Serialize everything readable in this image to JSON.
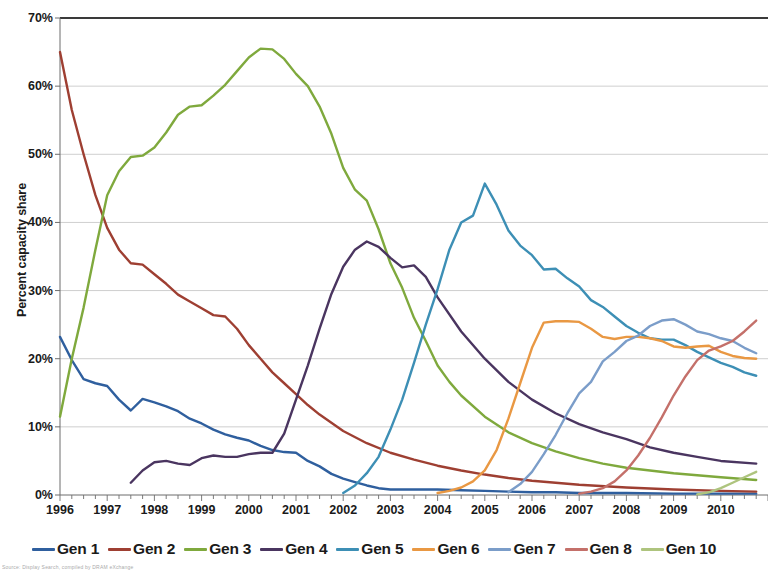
{
  "chart_data": {
    "type": "line",
    "title": "",
    "xlabel": "",
    "ylabel": "Percent capacity share",
    "xlim": [
      1996,
      2011
    ],
    "ylim": [
      0,
      0.7
    ],
    "ytick_labels": [
      "0%",
      "10%",
      "20%",
      "30%",
      "40%",
      "50%",
      "60%",
      "70%"
    ],
    "ytick_values": [
      0,
      10,
      20,
      30,
      40,
      50,
      60,
      70
    ],
    "xtick_labels": [
      "1996",
      "1997",
      "1998",
      "1999",
      "2000",
      "2001",
      "2002",
      "2003",
      "2004",
      "2005",
      "2006",
      "2007",
      "2008",
      "2009",
      "2010"
    ],
    "xtick_values": [
      1996,
      1997,
      1998,
      1999,
      2000,
      2001,
      2002,
      2003,
      2004,
      2005,
      2006,
      2007,
      2008,
      2009,
      2010
    ],
    "minor_xticks_per_year": 4,
    "grid": "horizontal",
    "legend_position": "bottom",
    "series": [
      {
        "name": "Gen 1",
        "color": "#2f5f9e",
        "x": [
          1996.0,
          1996.25,
          1996.5,
          1996.75,
          1997.0,
          1997.25,
          1997.5,
          1997.75,
          1998.0,
          1998.25,
          1998.5,
          1998.75,
          1999.0,
          1999.25,
          1999.5,
          1999.75,
          2000.0,
          2000.25,
          2000.5,
          2000.75,
          2001.0,
          2001.25,
          2001.5,
          2001.75,
          2002.0,
          2002.25,
          2002.5,
          2002.75,
          2003.0,
          2003.5,
          2004.0,
          2004.5,
          2005.0,
          2005.5,
          2006.0,
          2006.5,
          2007.0,
          2008.0,
          2009.0,
          2010.0,
          2010.75
        ],
        "y": [
          23.2,
          19.8,
          17.0,
          16.4,
          16.0,
          14.0,
          12.4,
          14.1,
          13.6,
          13.0,
          12.3,
          11.2,
          10.5,
          9.6,
          8.9,
          8.4,
          8.0,
          7.2,
          6.6,
          6.3,
          6.2,
          5.0,
          4.2,
          3.1,
          2.4,
          1.9,
          1.4,
          1.0,
          0.8,
          0.8,
          0.8,
          0.7,
          0.6,
          0.5,
          0.4,
          0.4,
          0.3,
          0.3,
          0.2,
          0.2,
          0.2
        ]
      },
      {
        "name": "Gen 2",
        "color": "#9e3f32",
        "x": [
          1996.0,
          1996.25,
          1996.5,
          1996.75,
          1997.0,
          1997.25,
          1997.5,
          1997.75,
          1998.0,
          1998.25,
          1998.5,
          1998.75,
          1999.0,
          1999.25,
          1999.5,
          1999.75,
          2000.0,
          2000.25,
          2000.5,
          2000.75,
          2001.0,
          2001.25,
          2001.5,
          2001.75,
          2002.0,
          2002.5,
          2003.0,
          2003.5,
          2004.0,
          2004.5,
          2005.0,
          2005.5,
          2006.0,
          2006.5,
          2007.0,
          2008.0,
          2009.0,
          2010.0,
          2010.75
        ],
        "y": [
          65.0,
          56.5,
          50.0,
          44.0,
          39.2,
          36.0,
          34.0,
          33.8,
          32.4,
          31.0,
          29.4,
          28.4,
          27.4,
          26.4,
          26.2,
          24.4,
          22.0,
          20.0,
          18.0,
          16.4,
          14.8,
          13.2,
          11.8,
          10.6,
          9.4,
          7.6,
          6.2,
          5.2,
          4.3,
          3.6,
          3.0,
          2.5,
          2.1,
          1.8,
          1.5,
          1.1,
          0.8,
          0.6,
          0.5
        ]
      },
      {
        "name": "Gen 3",
        "color": "#7fa93d",
        "x": [
          1996.0,
          1996.25,
          1996.5,
          1996.75,
          1997.0,
          1997.25,
          1997.5,
          1997.75,
          1998.0,
          1998.25,
          1998.5,
          1998.75,
          1999.0,
          1999.25,
          1999.5,
          1999.75,
          2000.0,
          2000.25,
          2000.5,
          2000.75,
          2001.0,
          2001.25,
          2001.5,
          2001.75,
          2002.0,
          2002.25,
          2002.5,
          2002.75,
          2003.0,
          2003.25,
          2003.5,
          2003.75,
          2004.0,
          2004.25,
          2004.5,
          2005.0,
          2005.5,
          2006.0,
          2006.5,
          2007.0,
          2007.5,
          2008.0,
          2009.0,
          2010.0,
          2010.75
        ],
        "y": [
          11.5,
          20.0,
          27.5,
          36.0,
          44.0,
          47.5,
          49.6,
          49.8,
          51.0,
          53.2,
          55.8,
          57.0,
          57.2,
          58.6,
          60.2,
          62.2,
          64.2,
          65.5,
          65.4,
          64.0,
          61.8,
          60.0,
          57.0,
          53.0,
          48.0,
          44.8,
          43.2,
          39.0,
          34.0,
          30.4,
          26.0,
          22.6,
          19.0,
          16.6,
          14.6,
          11.5,
          9.2,
          7.6,
          6.4,
          5.4,
          4.6,
          4.0,
          3.2,
          2.6,
          2.2
        ]
      },
      {
        "name": "Gen 4",
        "color": "#4a3560",
        "x": [
          1997.5,
          1997.75,
          1998.0,
          1998.25,
          1998.5,
          1998.75,
          1999.0,
          1999.25,
          1999.5,
          1999.75,
          2000.0,
          2000.25,
          2000.5,
          2000.75,
          2001.0,
          2001.25,
          2001.5,
          2001.75,
          2002.0,
          2002.25,
          2002.5,
          2002.75,
          2003.0,
          2003.25,
          2003.5,
          2003.75,
          2004.0,
          2004.5,
          2005.0,
          2005.5,
          2006.0,
          2006.5,
          2007.0,
          2007.5,
          2008.0,
          2008.5,
          2009.0,
          2009.5,
          2010.0,
          2010.75
        ],
        "y": [
          1.8,
          3.6,
          4.8,
          5.0,
          4.6,
          4.4,
          5.4,
          5.8,
          5.6,
          5.6,
          6.0,
          6.2,
          6.2,
          9.0,
          14.0,
          19.0,
          24.4,
          29.5,
          33.5,
          36.0,
          37.2,
          36.4,
          34.8,
          33.4,
          33.7,
          32.0,
          29.0,
          24.0,
          20.0,
          16.6,
          14.0,
          12.0,
          10.4,
          9.2,
          8.2,
          7.0,
          6.2,
          5.6,
          5.0,
          4.6
        ]
      },
      {
        "name": "Gen 5",
        "color": "#3d8fb5",
        "x": [
          2002.0,
          2002.25,
          2002.5,
          2002.75,
          2003.0,
          2003.25,
          2003.5,
          2003.75,
          2004.0,
          2004.25,
          2004.5,
          2004.75,
          2005.0,
          2005.25,
          2005.5,
          2005.75,
          2006.0,
          2006.25,
          2006.5,
          2006.75,
          2007.0,
          2007.25,
          2007.5,
          2007.75,
          2008.0,
          2008.25,
          2008.5,
          2008.75,
          2009.0,
          2009.25,
          2009.5,
          2009.75,
          2010.0,
          2010.25,
          2010.5,
          2010.75
        ],
        "y": [
          0.3,
          1.4,
          3.2,
          5.6,
          9.6,
          14.0,
          19.4,
          25.0,
          30.2,
          36.0,
          40.0,
          41.0,
          45.7,
          42.6,
          38.8,
          36.6,
          35.2,
          33.1,
          33.2,
          31.8,
          30.6,
          28.6,
          27.6,
          26.2,
          24.8,
          23.8,
          23.0,
          22.8,
          22.8,
          22.0,
          21.0,
          20.2,
          19.4,
          18.8,
          18.0,
          17.5
        ]
      },
      {
        "name": "Gen 6",
        "color": "#e99843",
        "x": [
          2004.0,
          2004.25,
          2004.5,
          2004.75,
          2005.0,
          2005.25,
          2005.5,
          2005.75,
          2006.0,
          2006.25,
          2006.5,
          2006.75,
          2007.0,
          2007.25,
          2007.5,
          2007.75,
          2008.0,
          2008.25,
          2008.5,
          2008.75,
          2009.0,
          2009.25,
          2009.5,
          2009.75,
          2010.0,
          2010.25,
          2010.5,
          2010.75
        ],
        "y": [
          0.3,
          0.6,
          1.1,
          2.0,
          3.6,
          6.6,
          11.2,
          16.4,
          21.6,
          25.3,
          25.5,
          25.5,
          25.4,
          24.4,
          23.2,
          22.9,
          23.2,
          23.2,
          23.0,
          22.6,
          21.8,
          21.6,
          21.8,
          21.9,
          21.0,
          20.4,
          20.1,
          20.0
        ]
      },
      {
        "name": "Gen 7",
        "color": "#7b9dc9",
        "x": [
          2005.5,
          2005.75,
          2006.0,
          2006.25,
          2006.5,
          2006.75,
          2007.0,
          2007.25,
          2007.5,
          2007.75,
          2008.0,
          2008.25,
          2008.5,
          2008.75,
          2009.0,
          2009.25,
          2009.5,
          2009.75,
          2010.0,
          2010.25,
          2010.5,
          2010.75
        ],
        "y": [
          0.4,
          1.6,
          3.4,
          6.0,
          8.8,
          12.0,
          14.9,
          16.6,
          19.6,
          21.0,
          22.6,
          23.4,
          24.8,
          25.6,
          25.8,
          25.0,
          24.0,
          23.6,
          23.0,
          22.6,
          21.6,
          20.8
        ]
      },
      {
        "name": "Gen 8",
        "color": "#c4706a",
        "x": [
          2007.0,
          2007.25,
          2007.5,
          2007.75,
          2008.0,
          2008.25,
          2008.5,
          2008.75,
          2009.0,
          2009.25,
          2009.5,
          2009.75,
          2010.0,
          2010.25,
          2010.5,
          2010.75
        ],
        "y": [
          0.2,
          0.5,
          1.0,
          2.0,
          3.6,
          5.8,
          8.4,
          11.4,
          14.6,
          17.4,
          19.8,
          21.2,
          21.8,
          22.6,
          24.0,
          25.6
        ]
      },
      {
        "name": "Gen 10",
        "color": "#aec47e",
        "x": [
          2009.5,
          2009.75,
          2010.0,
          2010.25,
          2010.5,
          2010.75
        ],
        "y": [
          0.1,
          0.4,
          1.0,
          1.8,
          2.6,
          3.4
        ]
      }
    ]
  },
  "legend": {
    "items": [
      {
        "label": "Gen 1",
        "color": "#2f5f9e"
      },
      {
        "label": "Gen 2",
        "color": "#9e3f32"
      },
      {
        "label": "Gen 3",
        "color": "#7fa93d"
      },
      {
        "label": "Gen 4",
        "color": "#4a3560"
      },
      {
        "label": "Gen 5",
        "color": "#3d8fb5"
      },
      {
        "label": "Gen 6",
        "color": "#e99843"
      },
      {
        "label": "Gen 7",
        "color": "#7b9dc9"
      },
      {
        "label": "Gen 8",
        "color": "#c4706a"
      },
      {
        "label": "Gen 10",
        "color": "#aec47e"
      }
    ]
  },
  "footnote": "Source: Display Search, compiled by DRAM eXchange"
}
